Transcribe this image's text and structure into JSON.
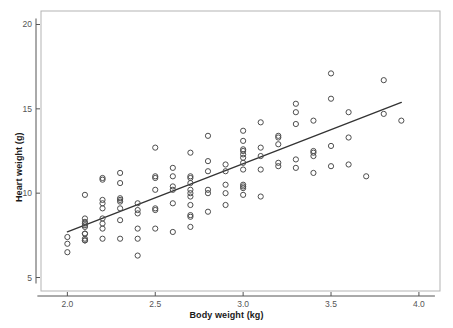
{
  "chart_data": {
    "type": "scatter",
    "title": "",
    "xlabel": "Body weight (kg)",
    "ylabel": "Heart weight (g)",
    "xlim": [
      1.85,
      4.12
    ],
    "ylim": [
      4.2,
      20.8
    ],
    "xticks": [
      2.0,
      2.5,
      3.0,
      3.5,
      4.0
    ],
    "xticklabels": [
      "2.0",
      "2.5",
      "3.0",
      "3.5",
      "4.0"
    ],
    "yticks": [
      5,
      10,
      15,
      20
    ],
    "yticklabels": [
      "5",
      "10",
      "15",
      "20"
    ],
    "grid": false,
    "legend": null,
    "marker": "open-circle",
    "marker_color": "#4d4d4d",
    "line_color": "#333333",
    "panel_border_color": "#b3b3b3",
    "background": "#ffffff",
    "fit_line": {
      "type": "linear-regression",
      "intercept": -0.3567,
      "slope": 4.0341,
      "x_start": 2.0,
      "x_end": 3.9,
      "y_start": 7.71,
      "y_end": 15.38
    },
    "x": [
      2.0,
      2.0,
      2.0,
      2.1,
      2.1,
      2.1,
      2.1,
      2.1,
      2.1,
      2.1,
      2.1,
      2.1,
      2.1,
      2.1,
      2.2,
      2.2,
      2.2,
      2.2,
      2.2,
      2.2,
      2.2,
      2.2,
      2.2,
      2.3,
      2.3,
      2.3,
      2.3,
      2.3,
      2.3,
      2.3,
      2.3,
      2.4,
      2.4,
      2.4,
      2.4,
      2.4,
      2.4,
      2.5,
      2.5,
      2.5,
      2.5,
      2.5,
      2.5,
      2.5,
      2.6,
      2.6,
      2.6,
      2.6,
      2.6,
      2.6,
      2.7,
      2.7,
      2.7,
      2.7,
      2.7,
      2.7,
      2.7,
      2.7,
      2.7,
      2.7,
      2.7,
      2.8,
      2.8,
      2.8,
      2.8,
      2.8,
      2.8,
      2.9,
      2.9,
      2.9,
      2.9,
      2.9,
      3.0,
      3.0,
      3.0,
      3.0,
      3.0,
      3.0,
      3.0,
      3.0,
      3.0,
      3.0,
      3.0,
      3.0,
      3.1,
      3.1,
      3.1,
      3.1,
      3.1,
      3.2,
      3.2,
      3.2,
      3.2,
      3.2,
      3.3,
      3.3,
      3.3,
      3.3,
      3.3,
      3.4,
      3.4,
      3.4,
      3.4,
      3.4,
      3.5,
      3.5,
      3.5,
      3.5,
      3.6,
      3.6,
      3.6,
      3.7,
      3.8,
      3.8,
      3.9
    ],
    "y": [
      6.5,
      7.0,
      7.4,
      7.2,
      7.3,
      7.6,
      8.0,
      8.1,
      8.2,
      8.3,
      8.5,
      9.9,
      7.2,
      7.6,
      7.9,
      8.2,
      8.5,
      9.1,
      9.6,
      10.8,
      10.9,
      7.3,
      9.4,
      7.3,
      8.4,
      9.1,
      9.5,
      9.6,
      9.7,
      10.6,
      11.2,
      6.3,
      7.3,
      7.9,
      8.8,
      9.0,
      9.4,
      7.9,
      9.0,
      9.1,
      10.2,
      10.9,
      11.0,
      12.7,
      7.7,
      9.4,
      10.2,
      10.4,
      11.0,
      11.5,
      8.0,
      8.6,
      8.7,
      9.3,
      9.8,
      10.0,
      10.2,
      10.6,
      10.9,
      11.0,
      12.4,
      8.9,
      10.0,
      10.2,
      11.3,
      11.9,
      13.4,
      9.3,
      10.0,
      10.5,
      11.7,
      11.3,
      9.9,
      10.3,
      10.5,
      11.4,
      12.1,
      12.3,
      12.5,
      12.6,
      13.1,
      13.7,
      11.8,
      10.4,
      9.8,
      11.4,
      12.2,
      12.7,
      14.2,
      11.6,
      11.8,
      12.9,
      13.3,
      13.4,
      11.5,
      12.0,
      14.1,
      14.8,
      15.3,
      11.2,
      12.2,
      12.4,
      12.5,
      14.3,
      11.6,
      12.8,
      15.6,
      17.1,
      11.7,
      13.3,
      14.8,
      11.0,
      14.7,
      16.7,
      14.3
    ]
  },
  "axis": {
    "y_label": "Heart weight (g)",
    "x_label": "Body weight (kg)"
  }
}
